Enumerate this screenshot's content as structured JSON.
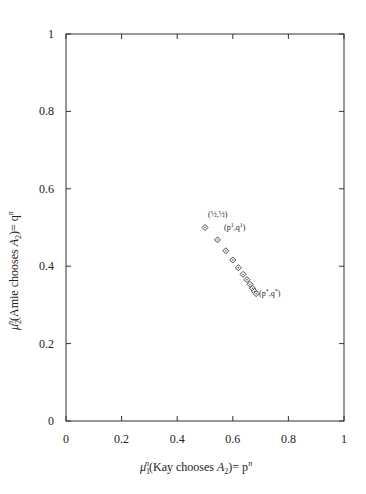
{
  "chart_data": {
    "type": "scatter",
    "title": "",
    "xlabel": "μ₁ⁿ(Kay chooses A₂)= pⁿ",
    "ylabel": "μ₂ⁿ(Amie chooses A₂)= qⁿ",
    "xlim": [
      0,
      1
    ],
    "ylim": [
      0,
      1
    ],
    "x_ticks": [
      "0",
      "0.2",
      "0.4",
      "0.6",
      "0.8",
      "1"
    ],
    "y_ticks": [
      "0",
      "0.2",
      "0.4",
      "0.6",
      "0.8",
      "1"
    ],
    "grid": false,
    "marker": "diamond",
    "series": [
      {
        "name": "belief path",
        "x": [
          0.5,
          0.545,
          0.575,
          0.6,
          0.62,
          0.637,
          0.651,
          0.662,
          0.671,
          0.678,
          0.684
        ],
        "y": [
          0.5,
          0.468,
          0.44,
          0.416,
          0.396,
          0.379,
          0.365,
          0.353,
          0.343,
          0.335,
          0.329
        ]
      }
    ],
    "annotations": [
      {
        "text": "(½,½)",
        "x": 0.5,
        "y": 0.5
      },
      {
        "text": "(p¹,q¹)",
        "x": 0.545,
        "y": 0.468
      },
      {
        "text": "(p*,q*)",
        "x": 0.684,
        "y": 0.329
      }
    ]
  },
  "labels": {
    "xlabel_mu": "μ",
    "xlabel_sub": "1",
    "xlabel_sup": "n",
    "xlabel_text": "(Kay chooses ",
    "xlabel_A": "A",
    "xlabel_A_sub": "2",
    "xlabel_end": ")= p",
    "xlabel_end_sup": "n",
    "ylabel_mu": "μ",
    "ylabel_sub": "2",
    "ylabel_sup": "n",
    "ylabel_text": "(Amie chooses ",
    "ylabel_A": "A",
    "ylabel_A_sub": "2",
    "ylabel_end": ")= q",
    "ylabel_end_sup": "n",
    "ann_start": "(½,½)",
    "ann_first_p": "(p",
    "ann_first_sup1": "1",
    "ann_first_q": ",q",
    "ann_first_sup2": "1",
    "ann_first_close": ")",
    "ann_star_p": "(p",
    "ann_star_sup1": "*",
    "ann_star_q": ",q",
    "ann_star_sup2": "*",
    "ann_star_close": ")"
  }
}
